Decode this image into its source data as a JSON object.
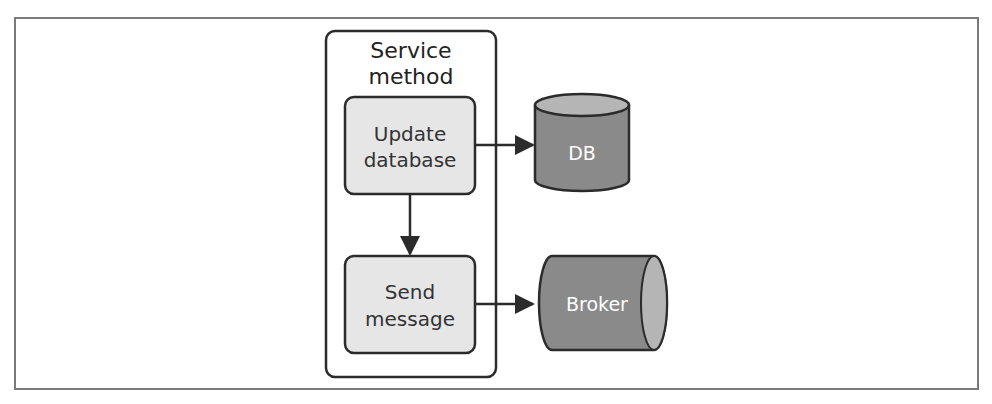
{
  "diagram": {
    "container": {
      "title_line1": "Service",
      "title_line2": "method"
    },
    "steps": [
      {
        "line1": "Update",
        "line2": "database"
      },
      {
        "line1": "Send",
        "line2": "message"
      }
    ],
    "targets": {
      "db": {
        "label": "DB",
        "shape": "cylinder-vertical"
      },
      "broker": {
        "label": "Broker",
        "shape": "cylinder-horizontal"
      }
    },
    "colors": {
      "step_fill": "#e6e6e6",
      "store_fill": "#8a8a8a",
      "store_top": "#b5b5b5",
      "stroke": "#2b2b2b",
      "frame": "#7a7a7a"
    }
  }
}
